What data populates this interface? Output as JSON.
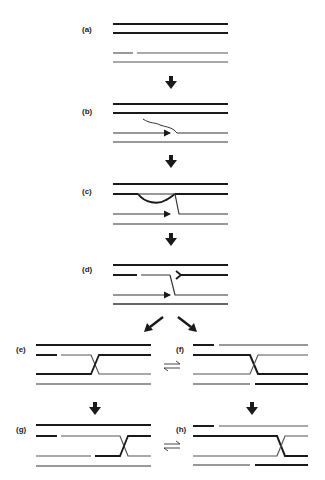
{
  "figure": {
    "panels": [
      {
        "id": "a",
        "label": "(a)"
      },
      {
        "id": "b",
        "label": "(b)"
      },
      {
        "id": "c",
        "label": "(c)"
      },
      {
        "id": "d",
        "label": "(d)"
      },
      {
        "id": "e",
        "label": "(e)"
      },
      {
        "id": "f",
        "label": "(f)"
      },
      {
        "id": "g",
        "label": "(g)"
      },
      {
        "id": "h",
        "label": "(h)"
      }
    ],
    "arrows": [
      {
        "from": "a",
        "to": "b",
        "icon": "down-arrow-icon"
      },
      {
        "from": "b",
        "to": "c",
        "icon": "down-arrow-icon"
      },
      {
        "from": "c",
        "to": "d",
        "icon": "down-arrow-icon"
      },
      {
        "from": "d",
        "to": "e",
        "icon": "diagonal-arrow-icon"
      },
      {
        "from": "d",
        "to": "f",
        "icon": "diagonal-arrow-icon"
      },
      {
        "from": "e",
        "to": "f",
        "icon": "equilibrium-arrows-icon"
      },
      {
        "from": "e",
        "to": "g",
        "icon": "down-arrow-icon"
      },
      {
        "from": "f",
        "to": "h",
        "icon": "down-arrow-icon"
      },
      {
        "from": "g",
        "to": "h",
        "icon": "equilibrium-arrows-icon"
      }
    ],
    "colors": {
      "strand": "#1a1a1a",
      "thin_strand": "#333333",
      "background": "#ffffff"
    }
  }
}
